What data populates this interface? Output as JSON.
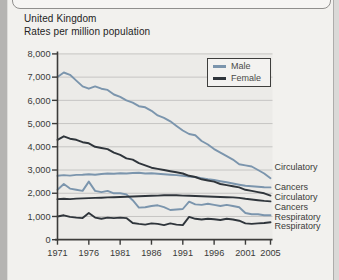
{
  "page": {
    "title": "United Kingdom",
    "subtitle": "Rates per million population"
  },
  "legend": {
    "items": [
      {
        "label": "Male",
        "series": "male"
      },
      {
        "label": "Female",
        "series": "female"
      }
    ]
  },
  "colors": {
    "male": "#7b95ad",
    "female": "#2f353b",
    "plot_bg": "#ecebe8",
    "grid": "#c6c5c3",
    "axis": "#3c3c3a",
    "page_bg": "#f2f1ee"
  },
  "chart_data": {
    "type": "line",
    "title": "United Kingdom",
    "subtitle": "Rates per million population",
    "ylabel": "Rates per million population",
    "ylim": [
      0,
      8000
    ],
    "grid": "horizontal",
    "legend_position": "top-right-inside",
    "x": [
      1971,
      1972,
      1973,
      1974,
      1975,
      1976,
      1977,
      1978,
      1979,
      1980,
      1981,
      1982,
      1983,
      1984,
      1985,
      1986,
      1987,
      1988,
      1989,
      1990,
      1991,
      1992,
      1993,
      1994,
      1995,
      1996,
      1997,
      1998,
      1999,
      2000,
      2001,
      2002,
      2003,
      2004,
      2005
    ],
    "x_ticks": [
      1971,
      1976,
      1981,
      1986,
      1991,
      1996,
      2001,
      2005
    ],
    "y_ticks": [
      "0",
      "1,000",
      "2,000",
      "3,000",
      "4,000",
      "5,000",
      "6,000",
      "7,000",
      "8,000"
    ],
    "series": [
      {
        "id": "male-circulatory",
        "name": "Male Circulatory",
        "sex": "male",
        "cause": "Circulatory",
        "values": [
          7000,
          7200,
          7100,
          6850,
          6600,
          6500,
          6600,
          6500,
          6450,
          6250,
          6150,
          6000,
          5900,
          5750,
          5700,
          5550,
          5350,
          5250,
          5100,
          4900,
          4700,
          4550,
          4500,
          4250,
          4100,
          3900,
          3750,
          3600,
          3450,
          3250,
          3200,
          3150,
          3000,
          2850,
          2650
        ]
      },
      {
        "id": "male-cancers",
        "name": "Male Cancers",
        "sex": "male",
        "cause": "Cancers",
        "values": [
          2750,
          2780,
          2760,
          2790,
          2800,
          2820,
          2800,
          2830,
          2850,
          2840,
          2860,
          2850,
          2870,
          2880,
          2850,
          2860,
          2840,
          2820,
          2800,
          2780,
          2750,
          2720,
          2700,
          2650,
          2600,
          2570,
          2520,
          2470,
          2420,
          2370,
          2320,
          2300,
          2280,
          2260,
          2250
        ]
      },
      {
        "id": "male-respiratory",
        "name": "Male Respiratory",
        "sex": "male",
        "cause": "Respiratory",
        "values": [
          2150,
          2400,
          2200,
          2150,
          2100,
          2500,
          2100,
          2050,
          2100,
          2000,
          2000,
          1950,
          1700,
          1380,
          1400,
          1450,
          1480,
          1400,
          1280,
          1300,
          1320,
          1640,
          1520,
          1500,
          1550,
          1500,
          1450,
          1500,
          1450,
          1400,
          1150,
          1100,
          1100,
          1050,
          1050
        ]
      },
      {
        "id": "female-circulatory",
        "name": "Female Circulatory",
        "sex": "female",
        "cause": "Circulatory",
        "values": [
          4300,
          4450,
          4350,
          4300,
          4200,
          4150,
          4000,
          3950,
          3900,
          3750,
          3650,
          3500,
          3450,
          3300,
          3200,
          3100,
          3050,
          3000,
          2950,
          2900,
          2850,
          2750,
          2700,
          2600,
          2550,
          2500,
          2400,
          2350,
          2300,
          2250,
          2150,
          2100,
          2050,
          2000,
          1900
        ]
      },
      {
        "id": "female-cancers",
        "name": "Female Cancers",
        "sex": "female",
        "cause": "Cancers",
        "values": [
          1750,
          1760,
          1750,
          1770,
          1780,
          1790,
          1800,
          1810,
          1820,
          1830,
          1840,
          1850,
          1860,
          1870,
          1880,
          1890,
          1900,
          1910,
          1920,
          1910,
          1900,
          1890,
          1880,
          1870,
          1860,
          1850,
          1840,
          1830,
          1820,
          1800,
          1760,
          1730,
          1700,
          1670,
          1650
        ]
      },
      {
        "id": "female-respiratory",
        "name": "Female Respiratory",
        "sex": "female",
        "cause": "Respiratory",
        "values": [
          1000,
          1050,
          980,
          950,
          930,
          1150,
          950,
          900,
          950,
          930,
          950,
          930,
          720,
          680,
          650,
          700,
          680,
          630,
          700,
          650,
          630,
          980,
          900,
          870,
          900,
          880,
          850,
          900,
          870,
          820,
          700,
          680,
          700,
          720,
          750
        ]
      }
    ],
    "right_labels": [
      {
        "text": "Circulatory",
        "sex": "male",
        "y": 167
      },
      {
        "text": "Cancers",
        "sex": "male",
        "y": 187
      },
      {
        "text": "Circulatory",
        "sex": "female",
        "y": 197
      },
      {
        "text": "Cancers",
        "sex": "female",
        "y": 207
      },
      {
        "text": "Respiratory",
        "sex": "male",
        "y": 217
      },
      {
        "text": "Respiratory",
        "sex": "female",
        "y": 226
      }
    ]
  }
}
